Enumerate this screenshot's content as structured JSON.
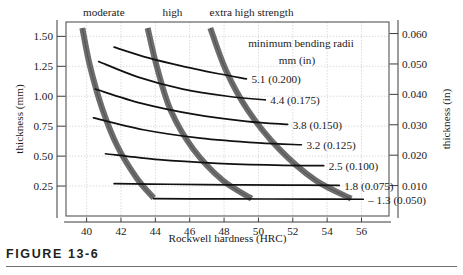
{
  "figure": {
    "caption": "FIGURE 13-6"
  },
  "chart_data": {
    "type": "line",
    "title": "",
    "xlabel": "Rockwell hardness (HRC)",
    "ylabel": "thickness (mm)",
    "y2label": "thickness (in)",
    "xlim": [
      38.8,
      57.6
    ],
    "ylim": [
      0.0,
      1.62
    ],
    "y2lim": [
      0.0,
      0.0638
    ],
    "grid": true,
    "legend_position": "none",
    "xticks": [
      40,
      42,
      44,
      46,
      48,
      50,
      52,
      54,
      56
    ],
    "xtick_labels": [
      "40",
      "42",
      "44",
      "46",
      "48",
      "50",
      "52",
      "54",
      "56"
    ],
    "yticks": [
      0.25,
      0.5,
      0.75,
      1.0,
      1.25,
      1.5
    ],
    "ytick_labels": [
      "0.25",
      "0.50",
      "0.75",
      "1.00",
      "1.25",
      "1.50"
    ],
    "y2ticks": [
      0.01,
      0.02,
      0.03,
      0.04,
      0.05,
      0.06
    ],
    "y2tick_labels": [
      "0.010",
      "0.020",
      "0.030",
      "0.040",
      "0.050",
      "0.060"
    ],
    "annotations": {
      "radii_title": "minimum bending radii",
      "radii_units": "mm   (in)"
    },
    "strength_bands": [
      {
        "name": "moderate",
        "label": "moderate",
        "label_x": 41.0,
        "points": [
          [
            39.75,
            1.57
          ],
          [
            40.2,
            1.25
          ],
          [
            40.9,
            0.9
          ],
          [
            41.8,
            0.58
          ],
          [
            42.9,
            0.32
          ],
          [
            43.9,
            0.15
          ]
        ]
      },
      {
        "name": "high",
        "label": "high",
        "label_x": 45.0,
        "points": [
          [
            43.55,
            1.57
          ],
          [
            44.1,
            1.24
          ],
          [
            44.9,
            0.88
          ],
          [
            46.2,
            0.56
          ],
          [
            47.9,
            0.3
          ],
          [
            49.6,
            0.145
          ]
        ]
      },
      {
        "name": "extra-high-strength",
        "label": "extra high strength",
        "label_x": 49.6,
        "points": [
          [
            47.2,
            1.57
          ],
          [
            48.1,
            1.22
          ],
          [
            49.4,
            0.88
          ],
          [
            51.2,
            0.56
          ],
          [
            53.3,
            0.3
          ],
          [
            55.4,
            0.145
          ]
        ]
      }
    ],
    "series": [
      {
        "name": "5.1 (0.200)",
        "radius_mm": 5.1,
        "radius_in": 0.2,
        "label": "5.1 (0.200)",
        "points": [
          [
            41.6,
            1.41
          ],
          [
            43.6,
            1.32
          ],
          [
            45.6,
            1.25
          ],
          [
            47.6,
            1.19
          ],
          [
            49.3,
            1.145
          ]
        ]
      },
      {
        "name": "4.4 (0.175)",
        "radius_mm": 4.4,
        "radius_in": 0.175,
        "label": "4.4 (0.175)",
        "points": [
          [
            40.7,
            1.29
          ],
          [
            43.0,
            1.16
          ],
          [
            45.6,
            1.06
          ],
          [
            48.2,
            1.0
          ],
          [
            50.4,
            0.97
          ]
        ]
      },
      {
        "name": "3.8 (0.150)",
        "radius_mm": 3.8,
        "radius_in": 0.15,
        "label": "3.8 (0.150)",
        "points": [
          [
            40.5,
            1.06
          ],
          [
            43.2,
            0.94
          ],
          [
            46.2,
            0.85
          ],
          [
            49.3,
            0.79
          ],
          [
            51.7,
            0.765
          ]
        ]
      },
      {
        "name": "3.2 (0.125)",
        "radius_mm": 3.2,
        "radius_in": 0.125,
        "label": "3.2 (0.125)",
        "points": [
          [
            40.4,
            0.82
          ],
          [
            43.3,
            0.72
          ],
          [
            46.6,
            0.65
          ],
          [
            50.0,
            0.61
          ],
          [
            52.5,
            0.595
          ]
        ]
      },
      {
        "name": "2.5 (0.100)",
        "radius_mm": 2.5,
        "radius_in": 0.1,
        "label": "2.5 (0.100)",
        "points": [
          [
            41.1,
            0.52
          ],
          [
            44.2,
            0.47
          ],
          [
            47.6,
            0.44
          ],
          [
            51.0,
            0.425
          ],
          [
            53.8,
            0.42
          ]
        ]
      },
      {
        "name": "1.8 (0.075)",
        "radius_mm": 1.8,
        "radius_in": 0.075,
        "label": "1.8 (0.075)",
        "points": [
          [
            41.6,
            0.27
          ],
          [
            44.8,
            0.265
          ],
          [
            48.3,
            0.26
          ],
          [
            51.7,
            0.258
          ],
          [
            54.7,
            0.255
          ]
        ]
      },
      {
        "name": "1.3 (0.050)",
        "radius_mm": 1.3,
        "radius_in": 0.05,
        "label": "– 1.3 (0.050)",
        "points": [
          [
            43.9,
            0.145
          ],
          [
            47.0,
            0.143
          ],
          [
            50.5,
            0.142
          ],
          [
            53.5,
            0.141
          ],
          [
            56.1,
            0.14
          ]
        ]
      }
    ]
  },
  "colors": {
    "band_fill": "#6d6d6d",
    "curve": "#111111",
    "grid": "#c8c8c8",
    "frame": "#555555",
    "text": "#1a1a1a",
    "caption": "#231f20",
    "rule": "#6f6f6f"
  }
}
